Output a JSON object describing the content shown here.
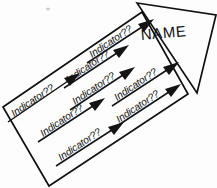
{
  "diagram": {
    "type": "arrow-banner-diagram",
    "background_color": "#ffffff",
    "ink_color": "#111111",
    "tilt_degrees": -21,
    "arrowhead": {
      "label": "NAME",
      "shape": "triangle"
    },
    "body": {
      "shape": "parallelogram"
    },
    "indicator_rows": [
      {
        "row": 1,
        "items": [
          {
            "label": "Indicator??"
          },
          {
            "label": "Indicator??"
          },
          {
            "label": "Indicator??"
          }
        ]
      },
      {
        "row": 2,
        "items": [
          {
            "label": "Indicator??"
          },
          {
            "label": "Indicator??"
          },
          {
            "label": "Indicator??"
          }
        ]
      },
      {
        "row": 3,
        "items": [
          {
            "label": "Indicator??"
          },
          {
            "label": "Indicator??"
          }
        ]
      }
    ]
  }
}
